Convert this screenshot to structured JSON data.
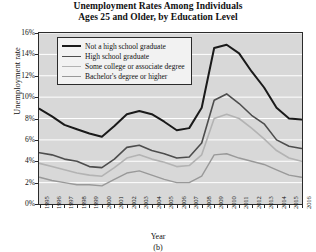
{
  "figure": {
    "title_line1": "Unemployment Rates Among Individuals",
    "title_line2": "Ages 25 and Older, by Education Level",
    "subcaption": "(b)"
  },
  "chart_data": {
    "type": "line",
    "title": "Unemployment Rates Among Individuals Ages 25 and Older, by Education Level",
    "xlabel": "Year",
    "ylabel": "Unemployment rate",
    "xlim": [
      1995,
      2016
    ],
    "ylim": [
      0,
      16
    ],
    "ytick_labels": [
      "0%",
      "2%",
      "4%",
      "6%",
      "8%",
      "10%",
      "12%",
      "14%",
      "16%"
    ],
    "ytick_values": [
      0,
      2,
      4,
      6,
      8,
      10,
      12,
      14,
      16
    ],
    "grid": "horizontal-white",
    "legend_position": "top-left",
    "categories": [
      1995,
      1996,
      1997,
      1998,
      1999,
      2000,
      2001,
      2002,
      2003,
      2004,
      2005,
      2006,
      2007,
      2008,
      2009,
      2010,
      2011,
      2012,
      2013,
      2014,
      2015,
      2016
    ],
    "tick_labels": [
      "1995",
      "1996",
      "1997",
      "1998",
      "1999",
      "2000",
      "2001",
      "2002",
      "2003",
      "2004",
      "2005",
      "2006",
      "2007",
      "2008",
      "2009",
      "2010",
      "2011",
      "2012",
      "2013",
      "2014",
      "2015",
      "2016"
    ],
    "series": [
      {
        "name": "Not a high school graduate",
        "color": "#1a1a1a",
        "width": 2.0,
        "values": [
          8.9,
          8.2,
          7.4,
          7.0,
          6.6,
          6.3,
          7.3,
          8.4,
          8.7,
          8.4,
          7.7,
          6.9,
          7.1,
          9.0,
          14.6,
          14.9,
          14.1,
          12.4,
          10.9,
          9.0,
          8.0,
          7.9
        ]
      },
      {
        "name": "High school graduate",
        "color": "#4d4d4d",
        "width": 1.6,
        "values": [
          4.8,
          4.6,
          4.2,
          4.0,
          3.5,
          3.4,
          4.2,
          5.3,
          5.5,
          5.0,
          4.7,
          4.3,
          4.4,
          5.7,
          9.7,
          10.3,
          9.4,
          8.3,
          7.5,
          6.0,
          5.4,
          5.2
        ]
      },
      {
        "name": "Some college or associate degree",
        "color": "#b3b3b3",
        "width": 1.6,
        "values": [
          3.8,
          3.5,
          3.2,
          2.9,
          2.7,
          2.6,
          3.4,
          4.3,
          4.6,
          4.2,
          3.9,
          3.5,
          3.6,
          4.6,
          8.0,
          8.4,
          8.0,
          7.1,
          6.1,
          5.0,
          4.3,
          4.0
        ]
      },
      {
        "name": "Bachelor's degree or higher",
        "color": "#999999",
        "width": 1.4,
        "values": [
          2.5,
          2.2,
          2.0,
          1.8,
          1.8,
          1.7,
          2.3,
          2.9,
          3.1,
          2.7,
          2.3,
          2.0,
          2.0,
          2.6,
          4.6,
          4.7,
          4.3,
          4.0,
          3.7,
          3.2,
          2.7,
          2.5
        ]
      }
    ],
    "legend_entries": [
      "Not a high school graduate",
      "High school graduate",
      "Some college or associate degree",
      "Bachelor's degree or higher"
    ]
  }
}
